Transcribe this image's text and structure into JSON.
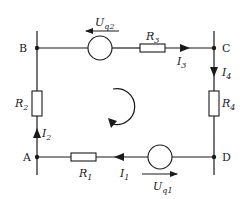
{
  "diagram": {
    "type": "electrical-circuit-mesh",
    "nodes": [
      {
        "id": "A",
        "label": "A"
      },
      {
        "id": "B",
        "label": "B"
      },
      {
        "id": "C",
        "label": "C"
      },
      {
        "id": "D",
        "label": "D"
      }
    ],
    "components": {
      "R1": {
        "symbol": "R",
        "sub": "1",
        "branch": "A-D"
      },
      "R2": {
        "symbol": "R",
        "sub": "2",
        "branch": "A-B"
      },
      "R3": {
        "symbol": "R",
        "sub": "3",
        "branch": "B-C"
      },
      "R4": {
        "symbol": "R",
        "sub": "4",
        "branch": "C-D"
      },
      "Uq1": {
        "symbol": "U",
        "sub": "q1",
        "branch": "A-D",
        "arrow_direction": "right"
      },
      "Uq2": {
        "symbol": "U",
        "sub": "q2",
        "branch": "B-C",
        "arrow_direction": "left"
      }
    },
    "currents": {
      "I1": {
        "symbol": "I",
        "sub": "1",
        "direction": "left"
      },
      "I2": {
        "symbol": "I",
        "sub": "2",
        "direction": "up"
      },
      "I3": {
        "symbol": "I",
        "sub": "3",
        "direction": "right"
      },
      "I4": {
        "symbol": "I",
        "sub": "4",
        "direction": "down"
      }
    },
    "mesh_orientation": "clockwise"
  }
}
